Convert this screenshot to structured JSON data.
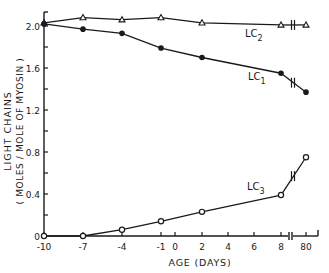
{
  "chart_data": {
    "type": "line",
    "title": "",
    "xlabel": "AGE (DAYS)",
    "ylabel_line1": "LIGHT  CHAINS",
    "ylabel_line2": "( MOLES / MOLE OF MYOSIN )",
    "ylim": [
      0,
      2.1
    ],
    "y_ticks": [
      0,
      0.4,
      0.8,
      1.2,
      1.6,
      2.0
    ],
    "y_tick_labels": [
      "0",
      "0.4",
      "0.8",
      "1.2",
      "1.6",
      "2.0"
    ],
    "x_ticks": [
      -10,
      -7,
      -4,
      -1,
      0,
      2,
      4,
      6,
      8,
      80
    ],
    "x_tick_labels": [
      "-10",
      "-7",
      "-4",
      "-1",
      "0",
      "2",
      "4",
      "6",
      "8",
      "80"
    ],
    "axis_break": "between 8 and 80",
    "grid": false,
    "x": [
      -10,
      -7,
      -4,
      -1,
      2,
      8,
      80
    ],
    "series": [
      {
        "name": "LC2",
        "label_main": "LC",
        "label_sub": "2",
        "marker": "open-triangle",
        "values": [
          2.03,
          2.08,
          2.06,
          2.08,
          2.03,
          2.01,
          2.01
        ]
      },
      {
        "name": "LC1",
        "label_main": "LC",
        "label_sub": "1",
        "marker": "filled-circle",
        "values": [
          2.02,
          1.97,
          1.93,
          1.79,
          1.7,
          1.55,
          1.37
        ]
      },
      {
        "name": "LC3",
        "label_main": "LC",
        "label_sub": "3",
        "marker": "open-circle",
        "values": [
          0.0,
          0.0,
          0.06,
          0.14,
          0.23,
          0.39,
          0.75
        ]
      }
    ]
  }
}
